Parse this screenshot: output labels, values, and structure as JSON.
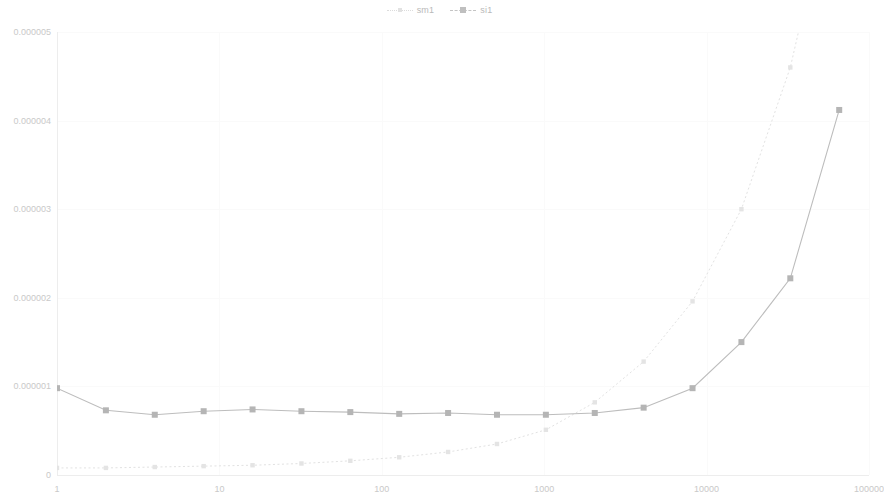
{
  "legend": {
    "position": "top-center",
    "entries": [
      {
        "label": "sm1",
        "marker": "small-square-marker",
        "line": "dotted",
        "color": "#e0e0e0"
      },
      {
        "label": "si1",
        "marker": "square-marker",
        "line": "dashed",
        "color": "#b8b8b8"
      }
    ]
  },
  "axes": {
    "y_ticks": [
      "0",
      "0.000001",
      "0.000002",
      "0.000003",
      "0.000004",
      "0.000005"
    ],
    "x_ticks": [
      "1",
      "10",
      "100",
      "1000",
      "10000",
      "100000"
    ]
  },
  "chart_data": {
    "type": "line",
    "title": "",
    "subtitle": "",
    "xlabel": "",
    "ylabel": "",
    "xscale": "log",
    "yscale": "linear",
    "xlim": [
      1,
      100000
    ],
    "ylim": [
      0,
      5e-06
    ],
    "grid": true,
    "legend_position": "top-center",
    "x": [
      1,
      2,
      4,
      8,
      16,
      32,
      64,
      128,
      256,
      512,
      1024,
      2048,
      4096,
      8192,
      16384,
      32768,
      65536
    ],
    "series": [
      {
        "name": "sm1",
        "color": "#e2e2e2",
        "linestyle": "dotted",
        "marker": "square",
        "values": [
          8e-08,
          8e-08,
          9e-08,
          1e-07,
          1.1e-07,
          1.3e-07,
          1.6e-07,
          2e-07,
          2.6e-07,
          3.5e-07,
          5.1e-07,
          8.2e-07,
          1.28e-06,
          1.96e-06,
          3e-06,
          4.6e-06,
          7e-06
        ]
      },
      {
        "name": "si1",
        "color": "#bdbdbd",
        "linestyle": "solid",
        "marker": "square",
        "values": [
          9.8e-07,
          7.3e-07,
          6.8e-07,
          7.2e-07,
          7.4e-07,
          7.2e-07,
          7.1e-07,
          6.9e-07,
          7e-07,
          6.8e-07,
          6.8e-07,
          7e-07,
          7.6e-07,
          9.8e-07,
          1.5e-06,
          2.22e-06,
          4.12e-06
        ]
      }
    ]
  }
}
